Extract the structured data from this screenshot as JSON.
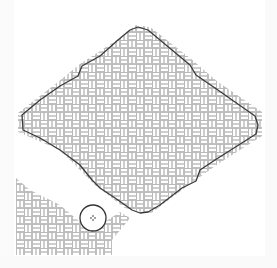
{
  "map": {
    "width": 277,
    "height": 268,
    "background": "#ffffff",
    "hatch": {
      "pattern": "basket-weave",
      "stroke_color": "#b8b8b8",
      "cell_size": 16
    },
    "outline": {
      "stroke_color": "#3a3a3a",
      "stroke_width": 1.3,
      "points": [
        [
          22,
          115
        ],
        [
          40,
          100
        ],
        [
          60,
          86
        ],
        [
          78,
          76
        ],
        [
          82,
          66
        ],
        [
          100,
          56
        ],
        [
          118,
          40
        ],
        [
          130,
          30
        ],
        [
          138,
          27
        ],
        [
          148,
          30
        ],
        [
          160,
          40
        ],
        [
          190,
          65
        ],
        [
          196,
          75
        ],
        [
          215,
          88
        ],
        [
          255,
          116
        ],
        [
          258,
          125
        ],
        [
          256,
          134
        ],
        [
          215,
          160
        ],
        [
          200,
          170
        ],
        [
          196,
          181
        ],
        [
          182,
          188
        ],
        [
          160,
          205
        ],
        [
          148,
          212
        ],
        [
          140,
          213
        ],
        [
          132,
          210
        ],
        [
          118,
          200
        ],
        [
          100,
          188
        ],
        [
          92,
          180
        ],
        [
          80,
          165
        ],
        [
          60,
          150
        ],
        [
          40,
          138
        ],
        [
          23,
          130
        ]
      ]
    },
    "hatched_regions": {
      "main_diamond": [
        [
          18,
          113
        ],
        [
          58,
          82
        ],
        [
          80,
          64
        ],
        [
          120,
          38
        ],
        [
          136,
          25
        ],
        [
          150,
          27
        ],
        [
          190,
          58
        ],
        [
          218,
          82
        ],
        [
          262,
          112
        ],
        [
          262,
          136
        ],
        [
          218,
          164
        ],
        [
          190,
          184
        ],
        [
          150,
          214
        ],
        [
          125,
          208
        ],
        [
          95,
          185
        ],
        [
          60,
          150
        ],
        [
          18,
          132
        ]
      ],
      "lower_left_band": [
        [
          16,
          178
        ],
        [
          30,
          190
        ],
        [
          60,
          205
        ],
        [
          80,
          222
        ],
        [
          100,
          225
        ],
        [
          120,
          212
        ],
        [
          130,
          218
        ],
        [
          112,
          240
        ],
        [
          112,
          255
        ],
        [
          16,
          255
        ]
      ]
    },
    "marker": {
      "type": "circle-with-crosshair",
      "cx": 93,
      "cy": 218,
      "r": 13,
      "stroke_color": "#333333"
    }
  },
  "labels": {
    "map_canvas": "Hatched polygon map view",
    "marker": "Location marker"
  }
}
